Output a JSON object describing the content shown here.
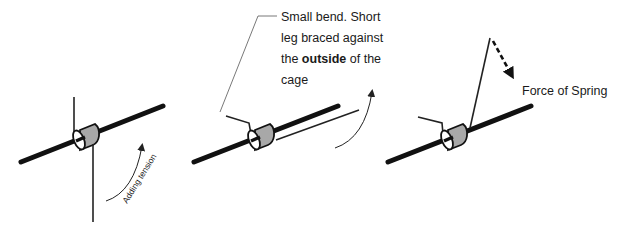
{
  "diagram": {
    "panels": [
      {
        "id": "panel-1",
        "annotation": "Adding tension"
      },
      {
        "id": "panel-2",
        "callout": {
          "lines": [
            "Small bend.  Short",
            "leg braced against",
            "the ",
            "outside",
            " of the",
            "cage"
          ],
          "line1": "Small bend.  Short",
          "line2": "leg braced against",
          "line3_pre": "the ",
          "line3_bold": "outside",
          "line3_post": " of the",
          "line4": "cage"
        }
      },
      {
        "id": "panel-3",
        "annotation": "Force of Spring"
      }
    ],
    "colors": {
      "rod": "#111111",
      "cylinder_fill": "#a8a8a8",
      "line": "#222222",
      "text": "#1a1a1a",
      "background": "#ffffff"
    }
  }
}
